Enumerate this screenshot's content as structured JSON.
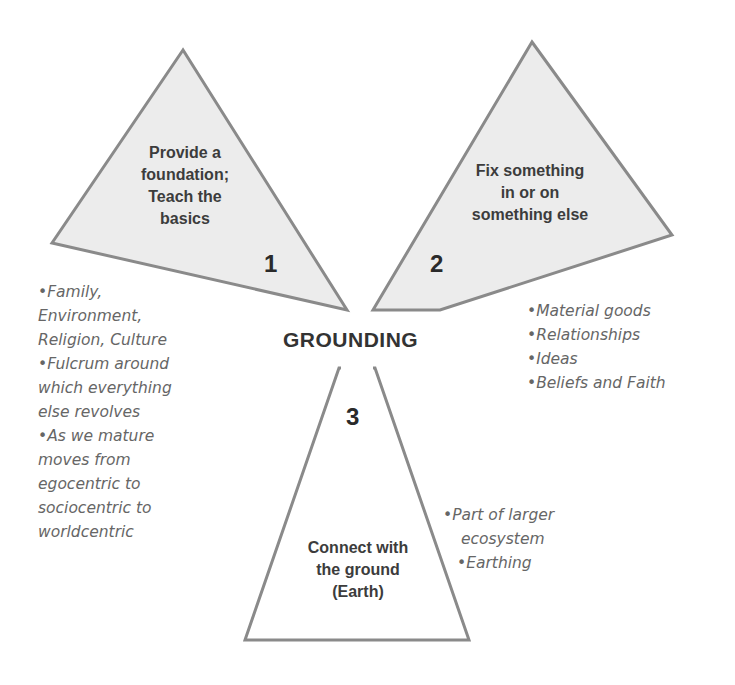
{
  "diagram": {
    "center_title": "GROUNDING",
    "colors": {
      "triangle_fill": "#ececec",
      "triangle_stroke": "#8a8a8a",
      "label_text": "#3c3c3c",
      "bullet_text": "#666666"
    },
    "sections": [
      {
        "number": "1",
        "label_lines": [
          "Provide a",
          "foundation;",
          "Teach the",
          "basics"
        ],
        "bullets": [
          "•Family,",
          "Environment,",
          "Religion, Culture",
          "•Fulcrum around",
          "which everything",
          "else revolves",
          "•As we mature",
          "moves from",
          "egocentric to",
          "sociocentric to",
          "worldcentric"
        ]
      },
      {
        "number": "2",
        "label_lines": [
          "Fix something",
          "in or on",
          "something else"
        ],
        "bullets": [
          "•Material goods",
          "•Relationships",
          "•Ideas",
          "•Beliefs and Faith"
        ]
      },
      {
        "number": "3",
        "label_lines": [
          "Connect with",
          "the ground",
          "(Earth)"
        ],
        "bullets": [
          "•Part of larger",
          "ecosystem",
          "•Earthing"
        ]
      }
    ]
  }
}
